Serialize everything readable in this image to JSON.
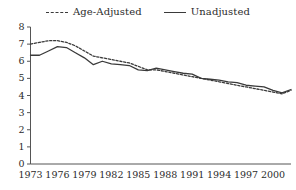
{
  "chart_data": {
    "type": "line",
    "title": "",
    "subtitle": "",
    "xlabel": "",
    "ylabel": "",
    "xlim": [
      1973,
      2002
    ],
    "ylim": [
      0,
      8
    ],
    "yticks": [
      0,
      1,
      2,
      3,
      4,
      5,
      6,
      7,
      8
    ],
    "xticks": [
      1973,
      1976,
      1979,
      1982,
      1985,
      1988,
      1991,
      1994,
      1997,
      2000
    ],
    "xtick_labels": [
      "1973",
      "1976",
      "1979",
      "1982",
      "1985",
      "1988",
      "1991",
      "1994",
      "1997",
      "2000"
    ],
    "ytick_labels": [
      "0",
      "1",
      "2",
      "3",
      "4",
      "5",
      "6",
      "7",
      "8"
    ],
    "grid": false,
    "legend_position": "top-center",
    "x": [
      1973,
      1974,
      1975,
      1976,
      1977,
      1978,
      1979,
      1980,
      1981,
      1982,
      1983,
      1984,
      1985,
      1986,
      1987,
      1988,
      1989,
      1990,
      1991,
      1992,
      1993,
      1994,
      1995,
      1996,
      1997,
      1998,
      1999,
      2000,
      2001,
      2002
    ],
    "series": [
      {
        "name": "Age-Adjusted",
        "style": "dashed",
        "color": "#3a3a3a",
        "values": [
          7.0,
          7.1,
          7.2,
          7.2,
          7.1,
          6.9,
          6.6,
          6.3,
          6.2,
          6.1,
          6.0,
          5.9,
          5.7,
          5.5,
          5.5,
          5.4,
          5.3,
          5.2,
          5.1,
          5.0,
          4.9,
          4.8,
          4.7,
          4.6,
          4.5,
          4.4,
          4.3,
          4.2,
          4.1,
          4.3
        ]
      },
      {
        "name": "Unadjusted",
        "style": "solid",
        "color": "#3a3a3a",
        "values": [
          6.35,
          6.35,
          6.6,
          6.85,
          6.8,
          6.5,
          6.2,
          5.8,
          6.0,
          5.85,
          5.8,
          5.75,
          5.5,
          5.45,
          5.6,
          5.5,
          5.4,
          5.3,
          5.25,
          5.0,
          4.95,
          4.9,
          4.8,
          4.75,
          4.6,
          4.55,
          4.5,
          4.3,
          4.15,
          4.35
        ]
      }
    ]
  },
  "legend": {
    "items": [
      {
        "label": "Age-Adjusted",
        "style": "dashed"
      },
      {
        "label": "Unadjusted",
        "style": "solid"
      }
    ]
  }
}
